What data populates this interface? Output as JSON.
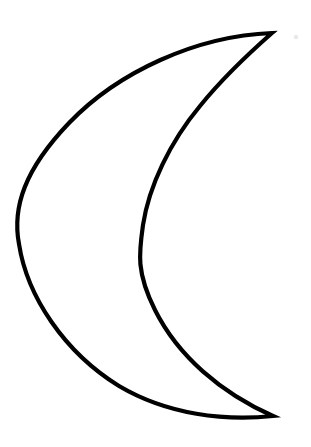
{
  "canvas": {
    "width": 311,
    "height": 447,
    "background_color": "#ffffff"
  },
  "artwork": {
    "name": "crescent-moon-outline",
    "title": "Crescent Moon",
    "description": "Line-art outline drawing of a crescent moon opening toward the right",
    "style": "outline",
    "fill_color": "none",
    "stroke_color": "#000000",
    "stroke_width": 4.2
  },
  "geometry": {
    "top_cusp": {
      "x": 272,
      "y": 33
    },
    "bottom_cusp": {
      "x": 273,
      "y": 416
    },
    "outer_arc": {
      "name": "outer-arc",
      "leftmost_point": {
        "x": 19,
        "y": 225
      },
      "bulge_direction": "left"
    },
    "inner_arc": {
      "name": "inner-arc",
      "leftmost_point": {
        "x": 143,
        "y": 225
      },
      "bulge_direction": "left"
    },
    "crescent_width_at_midheight": 124,
    "path": "M 272 33 C 196 36, 118 72, 69 123 C 25 169, 12 207, 19 244 C 27 296, 64 352, 119 386 C 168 415, 225 421, 273 416 C 221 393, 178 356, 155 310 C 136 272, 139 253, 143 225 C 149 186, 170 142, 200 106 C 221 80, 247 55, 272 33 Z"
  },
  "artifacts": [
    {
      "name": "scan-speck",
      "x": 296,
      "y": 37,
      "radius": 2.2,
      "color": "#e8e8e8"
    }
  ]
}
